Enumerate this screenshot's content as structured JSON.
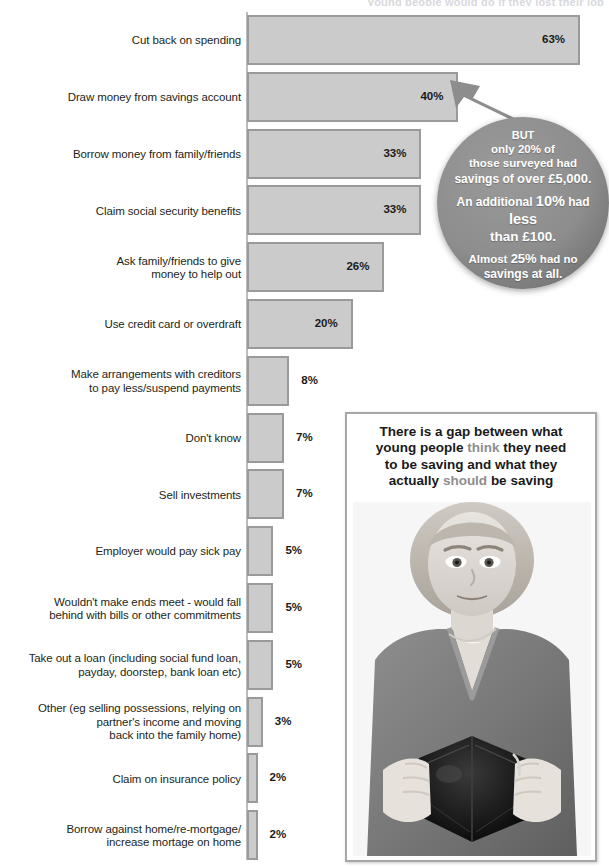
{
  "title_fragment": "young people would do if they lost their job",
  "chart_data": {
    "type": "bar",
    "orientation": "horizontal",
    "title": "",
    "xlabel": "",
    "ylabel": "",
    "xlim": [
      0,
      63
    ],
    "grid": false,
    "legend": null,
    "value_suffix": "%",
    "categories": [
      "Cut back on spending",
      "Draw money from savings account",
      "Borrow money from family/friends",
      "Claim social security benefits",
      "Ask family/friends to give\nmoney to help out",
      "Use credit card or overdraft",
      "Make arrangements with creditors\nto pay less/suspend payments",
      "Don't know",
      "Sell investments",
      "Employer would pay sick pay",
      "Wouldn't make ends meet - would fall\nbehind with bills or other commitments",
      "Take out a loan (including social fund loan,\npayday, doorstep, bank loan etc)",
      "Other (eg selling possessions, relying on\npartner's income and moving\nback into the family home)",
      "Claim on insurance policy",
      "Borrow against home/re-mortgage/\nincrease mortage on home"
    ],
    "values": [
      63,
      40,
      33,
      33,
      26,
      20,
      8,
      7,
      7,
      5,
      5,
      5,
      3,
      2,
      2
    ],
    "value_labels": [
      "63%",
      "40%",
      "33%",
      "33%",
      "26%",
      "20%",
      "8%",
      "7%",
      "7%",
      "5%",
      "5%",
      "5%",
      "3%",
      "2%",
      "2%"
    ],
    "bar_fill": "#cbcbcb",
    "bar_stroke": "#9a9a9a",
    "axis_color": "#b9bcc0"
  },
  "callout": {
    "name": "savings-callout",
    "background": "#8d8d8d",
    "text_color": "#ffffff",
    "lines": [
      "BUT",
      "only 20% of",
      "those surveyed had",
      "savings of over £5,000.",
      "An additional 10% had less",
      "than £100.",
      "Almost 25% had no",
      "savings at all."
    ],
    "line1": "BUT",
    "line2": "only 20% of",
    "line3": "those surveyed had",
    "line4a": "savings of ",
    "line4b": "over £5,000.",
    "line5a": "An additional ",
    "line5b": "10%",
    "line5c": " had ",
    "line5d": "less",
    "line6": "than £100.",
    "line7a": "Almost ",
    "line7b": "25%",
    "line7c": " had no",
    "line8": "savings at all."
  },
  "photo_panel": {
    "caption_line1": "There is a gap between what",
    "caption_line2a": "young people ",
    "caption_line2b": "think",
    "caption_line2c": " they need",
    "caption_line3": "to be saving and what they",
    "caption_line4a": "actually ",
    "caption_line4b": "should",
    "caption_line4c": " be saving",
    "muted_color": "#8e8e8e",
    "photo_alt": "young-woman-holding-empty-wallet"
  }
}
